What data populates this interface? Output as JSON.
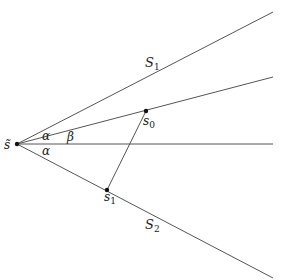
{
  "diagram": {
    "colors": {
      "line": "#555555",
      "point": "#111111",
      "text": "#222222"
    },
    "vertex": {
      "label": "s̃",
      "x": 17,
      "y": 144
    },
    "rays": [
      {
        "name": "S1",
        "label_base": "S",
        "label_sub": "1",
        "to": [
          273,
          12
        ],
        "label_pos": [
          145,
          67
        ]
      },
      {
        "name": "inner",
        "to": [
          273,
          77
        ]
      },
      {
        "name": "axis",
        "to": [
          273,
          144
        ]
      },
      {
        "name": "S2",
        "label_base": "S",
        "label_sub": "2",
        "to": [
          273,
          278
        ],
        "label_pos": [
          145,
          229
        ]
      }
    ],
    "points": [
      {
        "name": "s0",
        "label_base": "s",
        "label_sub": "0",
        "x": 146,
        "y": 111,
        "label_pos": [
          143,
          126
        ]
      },
      {
        "name": "s1",
        "label_base": "s",
        "label_sub": "1",
        "x": 107,
        "y": 190,
        "label_pos": [
          104,
          203
        ]
      }
    ],
    "angles": [
      {
        "label": "α",
        "pos": [
          42,
          140
        ]
      },
      {
        "label": "β",
        "pos": [
          67,
          140
        ]
      },
      {
        "label": "α",
        "pos": [
          42,
          155
        ]
      }
    ]
  }
}
